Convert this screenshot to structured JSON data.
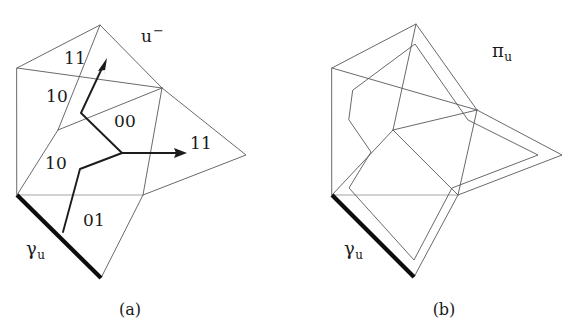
{
  "figure": {
    "background": "#ffffff",
    "ink_color": "#1a1a1a",
    "mesh_color": "#58585e",
    "bold_edge_color": "#0d0d0d",
    "width": 576,
    "height": 333
  },
  "panels": [
    {
      "id": "a",
      "caption": "(a)",
      "labels": {
        "u_minus": "u",
        "u_minus_sup": "−",
        "gamma": "γ",
        "gamma_sub": "u",
        "code_top": "11",
        "code_upper_left": "10",
        "code_center": "00",
        "code_right": "11",
        "code_lower_left": "10",
        "code_bottom": "01"
      },
      "outline_vertices": [
        [
          17,
          68
        ],
        [
          100,
          25
        ],
        [
          162,
          88
        ],
        [
          246,
          155
        ],
        [
          143,
          195
        ],
        [
          101,
          278
        ],
        [
          17,
          195
        ]
      ],
      "bold_edge": [
        [
          17,
          195
        ],
        [
          101,
          278
        ]
      ],
      "mesh_edges": [
        [
          [
            17,
            68
          ],
          [
            100,
            25
          ]
        ],
        [
          [
            100,
            25
          ],
          [
            162,
            88
          ]
        ],
        [
          [
            162,
            88
          ],
          [
            246,
            155
          ]
        ],
        [
          [
            246,
            155
          ],
          [
            143,
            195
          ]
        ],
        [
          [
            143,
            195
          ],
          [
            101,
            278
          ]
        ],
        [
          [
            101,
            278
          ],
          [
            17,
            195
          ]
        ],
        [
          [
            17,
            195
          ],
          [
            17,
            68
          ]
        ],
        [
          [
            17,
            68
          ],
          [
            162,
            88
          ]
        ],
        [
          [
            17,
            195
          ],
          [
            143,
            195
          ]
        ],
        [
          [
            58,
            130
          ],
          [
            162,
            88
          ]
        ],
        [
          [
            162,
            88
          ],
          [
            143,
            195
          ]
        ],
        [
          [
            100,
            25
          ],
          [
            58,
            130
          ]
        ],
        [
          [
            58,
            130
          ],
          [
            17,
            195
          ]
        ]
      ],
      "walk_paths": [
        [
          [
            105,
            62
          ],
          [
            81,
            113
          ],
          [
            122,
            153
          ]
        ],
        [
          [
            122,
            153
          ],
          [
            80,
            169
          ],
          [
            63,
            232
          ]
        ]
      ],
      "arrows": [
        {
          "name": "arrow-diagonal-11",
          "from": [
            81,
            113
          ],
          "to": [
            107,
            60
          ]
        },
        {
          "name": "arrow-horizontal-11",
          "from": [
            122,
            153
          ],
          "to": [
            186,
            153
          ]
        }
      ]
    },
    {
      "id": "b",
      "caption": "(b)",
      "labels": {
        "pi": "π",
        "pi_sub": "u",
        "gamma": "γ",
        "gamma_sub": "u"
      },
      "outline_vertices": [
        [
          332,
          68
        ],
        [
          416,
          24
        ],
        [
          477,
          110
        ],
        [
          562,
          155
        ],
        [
          458,
          195
        ],
        [
          414,
          277
        ],
        [
          332,
          195
        ]
      ],
      "bold_edge": [
        [
          332,
          195
        ],
        [
          414,
          277
        ]
      ],
      "mesh_edges": [
        [
          [
            332,
            68
          ],
          [
            416,
            24
          ]
        ],
        [
          [
            416,
            24
          ],
          [
            477,
            110
          ]
        ],
        [
          [
            477,
            110
          ],
          [
            562,
            155
          ]
        ],
        [
          [
            562,
            155
          ],
          [
            458,
            195
          ]
        ],
        [
          [
            458,
            195
          ],
          [
            414,
            277
          ]
        ],
        [
          [
            414,
            277
          ],
          [
            332,
            195
          ]
        ],
        [
          [
            332,
            195
          ],
          [
            332,
            68
          ]
        ],
        [
          [
            332,
            68
          ],
          [
            477,
            110
          ]
        ],
        [
          [
            332,
            195
          ],
          [
            458,
            195
          ]
        ],
        [
          [
            393,
            130
          ],
          [
            477,
            110
          ]
        ],
        [
          [
            477,
            110
          ],
          [
            458,
            195
          ]
        ],
        [
          [
            416,
            24
          ],
          [
            393,
            130
          ]
        ],
        [
          [
            393,
            130
          ],
          [
            332,
            195
          ]
        ],
        [
          [
            393,
            130
          ],
          [
            458,
            195
          ]
        ]
      ],
      "offset_outline": [
        [
          353,
          90
        ],
        [
          415,
          44
        ],
        [
          468,
          120
        ],
        [
          538,
          155
        ],
        [
          452,
          188
        ],
        [
          414,
          260
        ],
        [
          349,
          188
        ],
        [
          371,
          152
        ],
        [
          349,
          120
        ]
      ]
    }
  ]
}
